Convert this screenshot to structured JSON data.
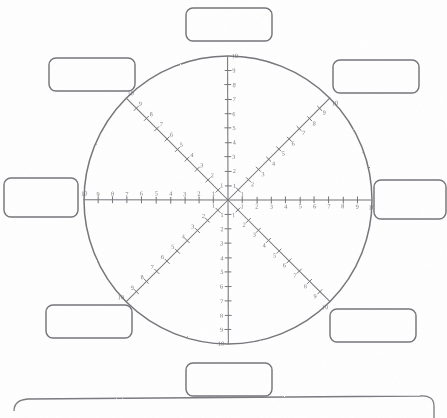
{
  "document": {
    "title": "Wheel of Life worksheet",
    "type": "radial-scale-diagram",
    "background_color": "#ffffff",
    "ink_color": "#76767c"
  },
  "wheel": {
    "center": {
      "x": 228,
      "y": 200
    },
    "radius": 144,
    "spoke_count": 8,
    "scale_min": 1,
    "scale_max": 10,
    "scale_labels": [
      "1",
      "2",
      "3",
      "4",
      "5",
      "6",
      "7",
      "8",
      "9",
      "10"
    ],
    "outer_value_label": "10"
  },
  "spokes": [
    {
      "id": "spoke-n",
      "name": "top",
      "angle_deg": -90,
      "label_value": "",
      "placeholder": "",
      "scale_labels": [
        "1",
        "2",
        "3",
        "4",
        "5",
        "6",
        "7",
        "8",
        "9",
        "10"
      ],
      "end_label": "10"
    },
    {
      "id": "spoke-ne",
      "name": "upper-right",
      "angle_deg": -45,
      "label_value": "",
      "placeholder": "",
      "scale_labels": [
        "1",
        "2",
        "3",
        "4",
        "5",
        "6",
        "7",
        "8",
        "9",
        "10"
      ],
      "end_label": "10"
    },
    {
      "id": "spoke-e",
      "name": "right",
      "angle_deg": 0,
      "label_value": "",
      "placeholder": "",
      "scale_labels": [
        "1",
        "2",
        "3",
        "4",
        "5",
        "6",
        "7",
        "8",
        "9",
        "10"
      ],
      "end_label": "10"
    },
    {
      "id": "spoke-se",
      "name": "lower-right",
      "angle_deg": 45,
      "label_value": "",
      "placeholder": "",
      "scale_labels": [
        "1",
        "2",
        "3",
        "4",
        "5",
        "6",
        "7",
        "8",
        "9",
        "10"
      ],
      "end_label": "10"
    },
    {
      "id": "spoke-s",
      "name": "bottom",
      "angle_deg": 90,
      "label_value": "",
      "placeholder": "",
      "scale_labels": [
        "1",
        "2",
        "3",
        "4",
        "5",
        "6",
        "7",
        "8",
        "9",
        "10"
      ],
      "end_label": "10"
    },
    {
      "id": "spoke-sw",
      "name": "lower-left",
      "angle_deg": 135,
      "label_value": "",
      "placeholder": "",
      "scale_labels": [
        "1",
        "2",
        "3",
        "4",
        "5",
        "6",
        "7",
        "8",
        "9",
        "10"
      ],
      "end_label": "10"
    },
    {
      "id": "spoke-w",
      "name": "left",
      "angle_deg": 180,
      "label_value": "",
      "placeholder": "",
      "scale_labels": [
        "1",
        "2",
        "3",
        "4",
        "5",
        "6",
        "7",
        "8",
        "9",
        "10"
      ],
      "end_label": "10"
    },
    {
      "id": "spoke-nw",
      "name": "upper-left",
      "angle_deg": -135,
      "label_value": "",
      "placeholder": "",
      "scale_labels": [
        "1",
        "2",
        "3",
        "4",
        "5",
        "6",
        "7",
        "8",
        "9",
        "10"
      ],
      "end_label": "10"
    }
  ],
  "label_boxes": [
    {
      "id": "box-top",
      "value": "",
      "x": 186,
      "y": 8,
      "w": 86,
      "h": 33
    },
    {
      "id": "box-upper-right",
      "value": "",
      "x": 333,
      "y": 60,
      "w": 86,
      "h": 33
    },
    {
      "id": "box-right",
      "value": "",
      "x": 374,
      "y": 180,
      "w": 72,
      "h": 39
    },
    {
      "id": "box-lower-right",
      "value": "",
      "x": 330,
      "y": 309,
      "w": 86,
      "h": 33
    },
    {
      "id": "box-bottom",
      "value": "",
      "x": 186,
      "y": 363,
      "w": 86,
      "h": 33
    },
    {
      "id": "box-lower-left",
      "value": "",
      "x": 46,
      "y": 305,
      "w": 86,
      "h": 33
    },
    {
      "id": "box-left",
      "value": "",
      "x": 4,
      "y": 178,
      "w": 74,
      "h": 39
    },
    {
      "id": "box-upper-left",
      "value": "",
      "x": 49,
      "y": 58,
      "w": 86,
      "h": 33
    }
  ],
  "footer": {
    "present": true,
    "text": "",
    "note": "top edge of a second panel clipped at the bottom of the page"
  }
}
